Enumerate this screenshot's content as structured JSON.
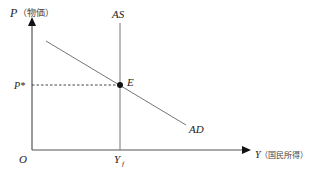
{
  "diagram": {
    "type": "economics-ad-as",
    "y_axis": {
      "symbol": "P",
      "label": "（物価）"
    },
    "x_axis": {
      "symbol": "Y",
      "label": "（国民所得）"
    },
    "origin_label": "O",
    "curves": {
      "as": {
        "label": "AS"
      },
      "ad": {
        "label": "AD"
      }
    },
    "equilibrium": {
      "point_label": "E",
      "price_label": "P*",
      "output_label_main": "Y",
      "output_label_sub": "f"
    },
    "colors": {
      "axis": "#444444",
      "curve": "#666666",
      "point": "#111111",
      "text": "#222222"
    }
  }
}
